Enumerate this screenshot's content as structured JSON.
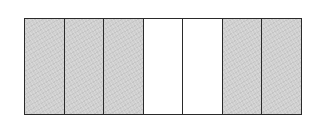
{
  "diagram": {
    "type": "fraction-bar",
    "total_parts": 7,
    "shaded_parts": 5,
    "colors": {
      "shaded": "#cfcfcf",
      "unshaded": "#ffffff",
      "border": "#2a2a2a"
    },
    "segments": [
      {
        "index": 1,
        "state": "shaded"
      },
      {
        "index": 2,
        "state": "shaded"
      },
      {
        "index": 3,
        "state": "shaded"
      },
      {
        "index": 4,
        "state": "unshaded"
      },
      {
        "index": 5,
        "state": "unshaded"
      },
      {
        "index": 6,
        "state": "shaded"
      },
      {
        "index": 7,
        "state": "shaded"
      }
    ]
  }
}
